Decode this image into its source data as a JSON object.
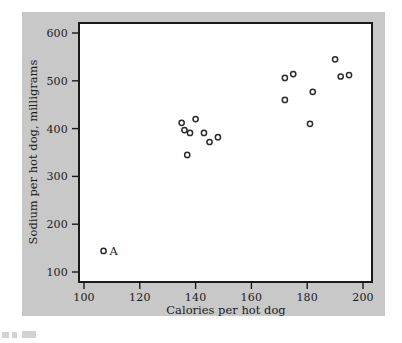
{
  "figure": {
    "panel_background": "#c8c8c8",
    "plot_background": "#ffffff",
    "frame_color": "#1a1a1a",
    "marker_color": "#2b2b2b"
  },
  "axes": {
    "x_title": "Calories per hot dog",
    "y_title": "Sodium per hot dog, milligrams",
    "x_ticks": [
      "100",
      "120",
      "140",
      "160",
      "180",
      "200"
    ],
    "y_ticks": [
      "100",
      "200",
      "300",
      "400",
      "500",
      "600"
    ]
  },
  "annotations": [
    {
      "label": "A",
      "x": 107,
      "y": 144
    }
  ],
  "chart_data": {
    "type": "scatter",
    "title": "",
    "xlabel": "Calories per hot dog",
    "ylabel": "Sodium per hot dog, milligrams",
    "xlim": [
      96,
      202
    ],
    "ylim": [
      85,
      615
    ],
    "xticks": [
      100,
      120,
      140,
      160,
      180,
      200
    ],
    "yticks": [
      100,
      200,
      300,
      400,
      500,
      600
    ],
    "grid": false,
    "legend": false,
    "series": [
      {
        "name": "hot dogs",
        "marker": "open-circle",
        "points": [
          {
            "x": 107,
            "y": 144,
            "label": "A"
          },
          {
            "x": 135,
            "y": 412
          },
          {
            "x": 136,
            "y": 397
          },
          {
            "x": 138,
            "y": 391
          },
          {
            "x": 137,
            "y": 345
          },
          {
            "x": 140,
            "y": 420
          },
          {
            "x": 143,
            "y": 391
          },
          {
            "x": 145,
            "y": 372
          },
          {
            "x": 148,
            "y": 382
          },
          {
            "x": 172,
            "y": 460
          },
          {
            "x": 172,
            "y": 506
          },
          {
            "x": 175,
            "y": 514
          },
          {
            "x": 181,
            "y": 410
          },
          {
            "x": 182,
            "y": 477
          },
          {
            "x": 190,
            "y": 545
          },
          {
            "x": 192,
            "y": 509
          },
          {
            "x": 195,
            "y": 512
          }
        ]
      }
    ]
  }
}
